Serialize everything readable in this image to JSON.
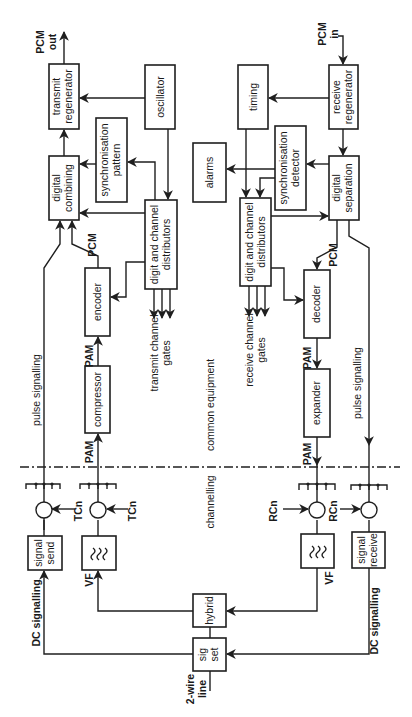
{
  "diagram": {
    "regions": {
      "common": "common equipment",
      "channelling": "channelling"
    },
    "blocks": {
      "transmit_regenerator": [
        "transmit",
        "regenerator"
      ],
      "oscillator": [
        "oscillator"
      ],
      "digital_combining": [
        "digital",
        "combining"
      ],
      "sync_pattern": [
        "synchronisation",
        "pattern"
      ],
      "tx_distributors": [
        "digit and channel",
        "distributors"
      ],
      "encoder": [
        "encoder"
      ],
      "compressor": [
        "compressor"
      ],
      "alarms": [
        "alarms"
      ],
      "timing": [
        "timing"
      ],
      "sync_detector": [
        "synchronisation",
        "detector"
      ],
      "receive_regenerator": [
        "receive",
        "regenerator"
      ],
      "digital_separation": [
        "digital",
        "separation"
      ],
      "rx_distributors": [
        "digit and channel",
        "distributors"
      ],
      "decoder": [
        "decoder"
      ],
      "expander": [
        "expander"
      ],
      "signal_send": [
        "signal",
        "send"
      ],
      "tx_filter": [
        "≈"
      ],
      "rx_filter": [
        "≈"
      ],
      "signal_receive": [
        "signal",
        "receive"
      ],
      "hybrid": [
        "hybrid"
      ],
      "sig_set": [
        "sig",
        "set"
      ]
    },
    "labels": {
      "pcm_out": [
        "PCM",
        "out"
      ],
      "pcm_in": [
        "PCM",
        "in"
      ],
      "pcm_tx": "PCM",
      "pcm_rx": "PCM",
      "pam_tx_1": "PAM",
      "pam_tx_2": "PAM",
      "pam_rx_1": "PAM",
      "pam_rx_2": "PAM",
      "tx_gates": [
        "transmit channel",
        "gates"
      ],
      "rx_gates": [
        "receive channel",
        "gates"
      ],
      "pulse_signalling_tx": "pulse signalling",
      "pulse_signalling_rx": "pulse signalling",
      "dc_signalling_tx": "DC signalling",
      "dc_signalling_rx": "DC signalling",
      "tcn_1": "TCn",
      "tcn_2": "TCn",
      "rcn_1": "RCn",
      "rcn_2": "RCn",
      "vf_tx": "VF",
      "vf_rx": "VF",
      "two_wire": [
        "2-wire",
        "line"
      ]
    }
  }
}
